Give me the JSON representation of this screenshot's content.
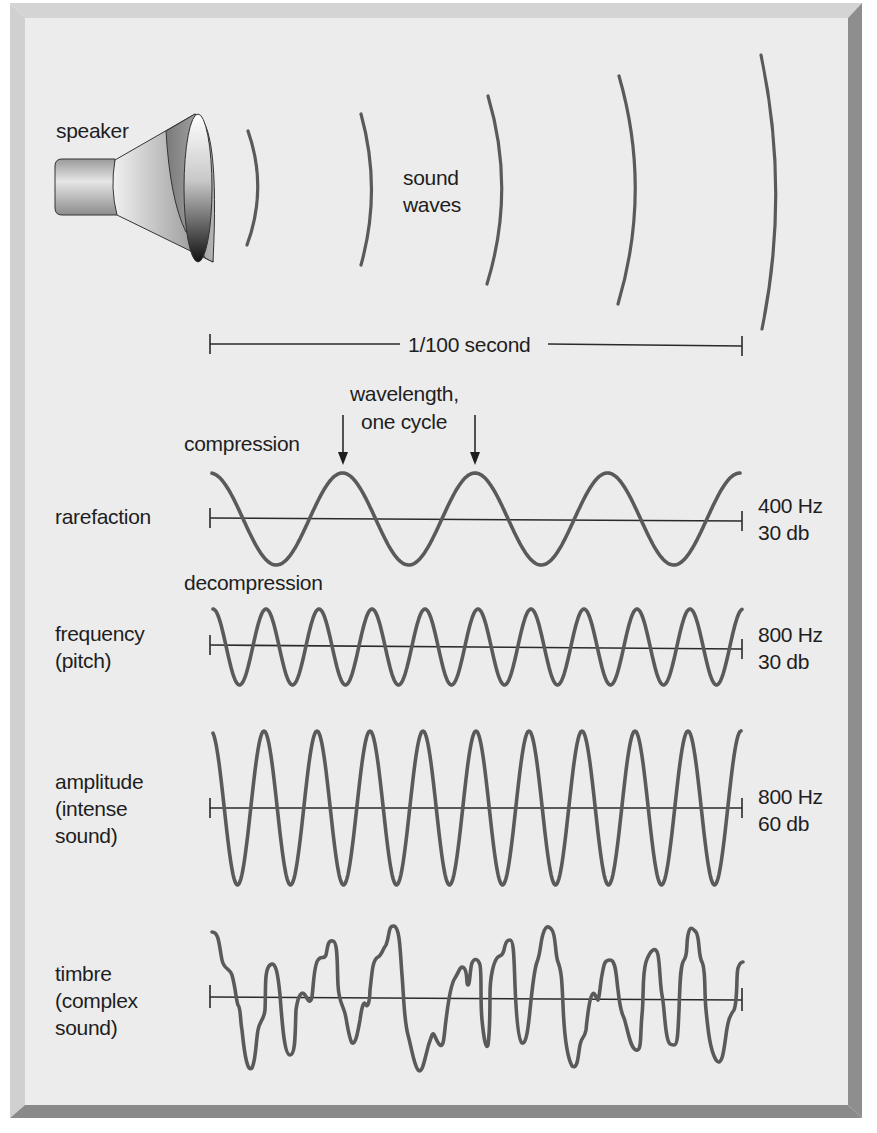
{
  "figure": {
    "colors": {
      "panel_bg": "#ececec",
      "bevel_light": "#d2d2d2",
      "bevel_dark": "#8a8a8a",
      "wave_stroke": "#5a5a5a",
      "axis_stroke": "#2a2a2a",
      "text": "#1e1e1e"
    },
    "speaker": {
      "label": "speaker",
      "icon": "speaker-icon"
    },
    "sound_waves": {
      "label_line1": "sound",
      "label_line2": "waves",
      "arc_count": 5
    },
    "time_scale": {
      "label": "1/100 second"
    },
    "annotations": {
      "wavelength_line1": "wavelength,",
      "wavelength_line2": "one cycle",
      "compression": "compression",
      "decompression": "decompression"
    },
    "rows": [
      {
        "id": "rarefaction",
        "label_lines": [
          "rarefaction"
        ],
        "freq": "400 Hz",
        "level": "30 db",
        "cycles": 4,
        "amplitude": "low"
      },
      {
        "id": "frequency",
        "label_lines": [
          "frequency",
          "(pitch)"
        ],
        "freq": "800 Hz",
        "level": "30 db",
        "cycles": 10,
        "amplitude": "low"
      },
      {
        "id": "amplitude",
        "label_lines": [
          "amplitude",
          "(intense",
          "sound)"
        ],
        "freq": "800 Hz",
        "level": "60 db",
        "cycles": 10,
        "amplitude": "high"
      },
      {
        "id": "timbre",
        "label_lines": [
          "timbre",
          "(complex",
          "sound)"
        ],
        "freq": "",
        "level": "",
        "cycles": null,
        "amplitude": "complex"
      }
    ]
  }
}
